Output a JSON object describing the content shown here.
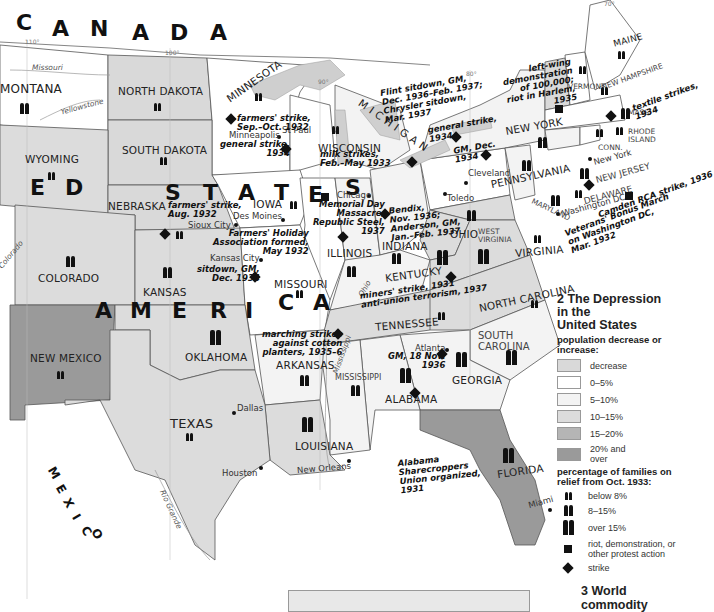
{
  "map": {
    "title": "2 The Depression in the United States",
    "country_letters": {
      "canada": [
        "C",
        "A",
        "N",
        "A",
        "D",
        "A"
      ],
      "united": [
        "E",
        "D"
      ],
      "states": [
        "S",
        "T",
        "A",
        "T",
        "E",
        "S"
      ],
      "america": [
        "A",
        "M",
        "E",
        "R",
        "I",
        "C",
        "A"
      ],
      "mexico": [
        "M",
        "E",
        "X",
        "I",
        "C",
        "O"
      ]
    },
    "states": [
      {
        "name": "MONTANA",
        "category": "0-5%",
        "relief": "8-15%"
      },
      {
        "name": "NORTH DAKOTA",
        "category": "decrease",
        "relief": "below 8%"
      },
      {
        "name": "MINNESOTA",
        "category": "0-5%",
        "relief": "below 8%"
      },
      {
        "name": "SOUTH DAKOTA",
        "category": "decrease",
        "relief": "below 8%"
      },
      {
        "name": "WISCONSIN",
        "category": "0-5%",
        "relief": "below 8%"
      },
      {
        "name": "MICHIGAN",
        "category": "5-10%",
        "relief": "below 8%"
      },
      {
        "name": "WYOMING",
        "category": "10-15%",
        "relief": "below 8%"
      },
      {
        "name": "NEBRASKA",
        "category": "decrease",
        "relief": "below 8%"
      },
      {
        "name": "IOWA",
        "category": "0-5%",
        "relief": "below 8%"
      },
      {
        "name": "ILLINOIS",
        "category": "0-5%",
        "relief": "8-15%"
      },
      {
        "name": "INDIANA",
        "category": "5-10%",
        "relief": "8-15%"
      },
      {
        "name": "OHIO",
        "category": "5-10%",
        "relief": "8-15%"
      },
      {
        "name": "PENNSYLVANIA",
        "category": "0-5%",
        "relief": "8-15%"
      },
      {
        "name": "NEW YORK",
        "category": "5-10%",
        "relief": "8-15%"
      },
      {
        "name": "VERMONT",
        "category": "decrease",
        "relief": "below 8%"
      },
      {
        "name": "NEW HAMPSHIRE",
        "category": "0-5%",
        "relief": "below 8%"
      },
      {
        "name": "MAINE",
        "category": "0-5%",
        "relief": "below 8%"
      },
      {
        "name": "MASS.",
        "category": "0-5%",
        "relief": "8-15%"
      },
      {
        "name": "CONN.",
        "category": "5-10%",
        "relief": "below 8%"
      },
      {
        "name": "RHODE ISLAND",
        "category": "0-5%",
        "relief": "below 8%"
      },
      {
        "name": "NEW JERSEY",
        "category": "5-10%",
        "relief": "8-15%"
      },
      {
        "name": "DELAWARE",
        "category": "5-10%",
        "relief": "below 8%"
      },
      {
        "name": "MARYLAND",
        "category": "10-15%",
        "relief": "8-15%"
      },
      {
        "name": "COLORADO",
        "category": "10-15%",
        "relief": "8-15%"
      },
      {
        "name": "KANSAS",
        "category": "10-15%",
        "relief": "8-15%"
      },
      {
        "name": "MISSOURI",
        "category": "0-5%",
        "relief": "below 8%"
      },
      {
        "name": "KENTUCKY",
        "category": "5-10%",
        "relief": "over 15%"
      },
      {
        "name": "WEST VIRGINIA",
        "category": "10-15%",
        "relief": "over 15%"
      },
      {
        "name": "VIRGINIA",
        "category": "10-15%",
        "relief": "below 8%"
      },
      {
        "name": "NEW MEXICO",
        "category": "20% and over",
        "relief": "below 8%"
      },
      {
        "name": "OKLAHOMA",
        "category": "10-15%",
        "relief": "over 15%"
      },
      {
        "name": "ARKANSAS",
        "category": "5-10%",
        "relief": "8-15%"
      },
      {
        "name": "TENNESSEE",
        "category": "10-15%",
        "relief": "below 8%"
      },
      {
        "name": "NORTH CAROLINA",
        "category": "10-15%",
        "relief": "below 8%"
      },
      {
        "name": "SOUTH CAROLINA",
        "category": "5-10%",
        "relief": "over 15%"
      },
      {
        "name": "GEORGIA",
        "category": "5-10%",
        "relief": "over 15%"
      },
      {
        "name": "ALABAMA",
        "category": "5-10%",
        "relief": "over 15%"
      },
      {
        "name": "MISSISSIPPI",
        "category": "5-10%",
        "relief": "below 8%"
      },
      {
        "name": "LOUISIANA",
        "category": "10-15%",
        "relief": "over 15%"
      },
      {
        "name": "TEXAS",
        "category": "10-15%",
        "relief": "below 8%"
      },
      {
        "name": "FLORIDA",
        "category": "20% and over",
        "relief": "over 15%"
      }
    ],
    "cities": [
      "Minneapolis",
      "St Paul",
      "Des Moines",
      "Sioux City",
      "Chicago",
      "Toledo",
      "Cleveland",
      "New York",
      "Washington DC",
      "Kansas City",
      "Atlanta",
      "Dallas",
      "Houston",
      "New Orleans",
      "Miami"
    ],
    "rivers": [
      "Missouri",
      "Yellowstone",
      "Ohio",
      "Mississippi",
      "Rio Grande",
      "Colorado"
    ],
    "longitudes": [
      "110°",
      "100°",
      "90°",
      "80°",
      "70°"
    ],
    "events": {
      "minnesota_farmers": "farmers' strike,\nSep.–Oct. 1932",
      "minneapolis_general": "general strike,\n1934",
      "wisconsin_milk": "milk strikes,\nFeb.–May 1933",
      "flint": "Flint sitdown, GM,\nDec. 1936–Feb. 1937;\nChrysler sitdown,\nMar. 1937",
      "general_1934": "general strike,\n1934",
      "gm_dec_1934": "GM, Dec.\n1934",
      "harlem": "left-wing\ndemonstration\nof 100,000;\nriot in Harlem,\n1935",
      "textile": "textile strikes,\n1934",
      "camden": "Camden RCA strike, 1936",
      "veterans": "Veterans' Bonus March\non Washington DC,\nMar. 1932",
      "nebraska_farmers": "farmers' strike,\nAug. 1932",
      "farmers_holiday": "Farmers' Holiday\nAssociation formed,\nMay 1932",
      "memorial_day": "Memorial Day\nMassacre,\nRepublic Steel,\n1937",
      "bendix": "Bendix,\nNov. 1936;\nAnderson, GM,\nJan.–Feb. 1937",
      "kansas_city": "sitdown, GM,\nDec. 1934",
      "kentucky": "miners' strike, 1931\nanti-union terrorism, 1937",
      "marching": "marching strikes\nagainst cotton\nplanters, 1935–6",
      "atlanta_gm": "GM, 18 Nov.\n1936",
      "alabama_union": "Alabama\nSharecroppers\nUnion organized,\n1931"
    }
  },
  "legend": {
    "title_line1": "2 The Depression",
    "title_line2": "in the",
    "title_line3": "United States",
    "population_heading": "population decrease or increase:",
    "population_items": [
      {
        "label": "decrease",
        "color": "#d9d9d9"
      },
      {
        "label": "0–5%",
        "color": "#ffffff"
      },
      {
        "label": "5–10%",
        "color": "#f3f3f3"
      },
      {
        "label": "10–15%",
        "color": "#dcdcdc"
      },
      {
        "label": "15–20%",
        "color": "#b5b5b5"
      },
      {
        "label": "20% and over",
        "color": "#9a9a9a"
      }
    ],
    "relief_heading": "percentage of families on relief from Oct. 1933:",
    "relief_items": [
      {
        "label": "below 8%",
        "icon": "small-figures-icon"
      },
      {
        "label": "8–15%",
        "icon": "medium-figures-icon"
      },
      {
        "label": "over 15%",
        "icon": "large-figures-icon"
      }
    ],
    "riot_label": "riot, demonstration, or other protest action",
    "strike_label": "strike"
  },
  "next_section": {
    "title": "3 World commodity"
  }
}
